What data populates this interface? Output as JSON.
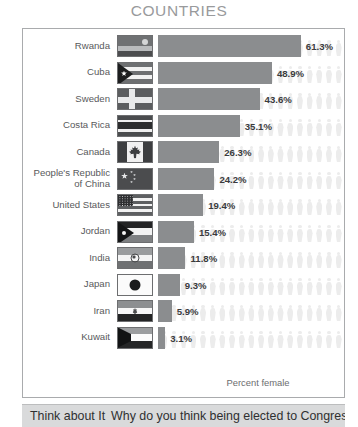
{
  "chart_title": "COUNTRIES",
  "axis_caption": "Percent female",
  "footer": {
    "lead": "Think about It",
    "text": "Why do you think being elected to Congress"
  },
  "colors": {
    "bar": "#8b8d8f",
    "ghost": "#ececec",
    "title": "#999a9c",
    "label": "#58595b",
    "value": "#3a3b3d",
    "frame_border": "#a9abad",
    "footer_band": "#d9dadb"
  },
  "chart_data": {
    "type": "bar",
    "orientation": "horizontal",
    "title": "COUNTRIES",
    "xlabel": "Percent female",
    "ylabel": "",
    "xlim": [
      0,
      65
    ],
    "grid": false,
    "legend": null,
    "categories": [
      "Rwanda",
      "Cuba",
      "Sweden",
      "Costa Rica",
      "Canada",
      "People's Republic\nof China",
      "United States",
      "Jordan",
      "India",
      "Japan",
      "Iran",
      "Kuwait"
    ],
    "values": [
      61.3,
      48.9,
      43.6,
      35.1,
      26.3,
      24.2,
      19.4,
      15.4,
      11.8,
      9.3,
      5.9,
      3.1
    ],
    "value_labels": [
      "61.3%",
      "48.9%",
      "43.6%",
      "35.1%",
      "26.3%",
      "24.2%",
      "19.4%",
      "15.4%",
      "11.8%",
      "9.3%",
      "5.9%",
      "3.1%"
    ],
    "flags": [
      "rwanda",
      "cuba",
      "sweden",
      "costarica",
      "canada",
      "china",
      "usa",
      "jordan",
      "india",
      "japan",
      "iran",
      "kuwait"
    ]
  }
}
